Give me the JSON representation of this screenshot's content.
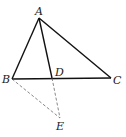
{
  "diagram": {
    "type": "geometry",
    "points": {
      "A": {
        "label": "A",
        "x": 39,
        "y": 18,
        "lx": 35,
        "ly": 15
      },
      "B": {
        "label": "B",
        "x": 12,
        "y": 79,
        "lx": 2,
        "ly": 83
      },
      "C": {
        "label": "C",
        "x": 111,
        "y": 78,
        "lx": 113,
        "ly": 84
      },
      "D": {
        "label": "D",
        "x": 52,
        "y": 78,
        "lx": 55,
        "ly": 76
      },
      "E": {
        "label": "E",
        "x": 60,
        "y": 118,
        "lx": 56,
        "ly": 130
      }
    },
    "segments": [
      {
        "from": "A",
        "to": "B",
        "style": "solid"
      },
      {
        "from": "A",
        "to": "C",
        "style": "solid"
      },
      {
        "from": "B",
        "to": "C",
        "style": "solid"
      },
      {
        "from": "A",
        "to": "D",
        "style": "solid"
      },
      {
        "from": "D",
        "to": "E",
        "style": "dashed"
      },
      {
        "from": "B",
        "to": "E",
        "style": "dashed"
      }
    ]
  }
}
